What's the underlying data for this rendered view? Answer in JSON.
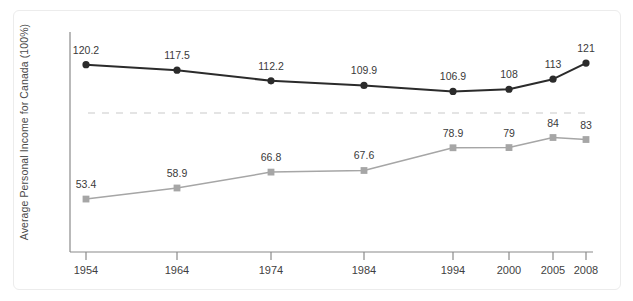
{
  "chart_data": {
    "type": "line",
    "title": "",
    "subtitle": "",
    "xlabel": "",
    "ylabel": "Average Personal Income for Canada (100%)",
    "categories": [
      "1954",
      "1964",
      "1974",
      "1984",
      "1994",
      "2000",
      "2005",
      "2008"
    ],
    "x": [
      1954,
      1964,
      1974,
      1984,
      1994,
      2000,
      2005,
      2008
    ],
    "xlim": [
      1954,
      2008
    ],
    "ylim": [
      40,
      130
    ],
    "grid": false,
    "legend": "none",
    "reference_line": {
      "value": 100,
      "style": "dashed",
      "color": "#d8d8d8",
      "label": ""
    },
    "series": [
      {
        "name": "upper-series",
        "color": "#2b2b2b",
        "marker": "circle",
        "values": [
          120.2,
          117.5,
          112.2,
          109.9,
          106.9,
          108,
          113,
          121
        ],
        "labels": [
          "120.2",
          "117.5",
          "112.2",
          "109.9",
          "106.9",
          "108",
          "113",
          "121"
        ]
      },
      {
        "name": "lower-series",
        "color": "#a6a6a6",
        "marker": "square",
        "values": [
          53.4,
          58.9,
          66.8,
          67.6,
          78.9,
          79,
          84,
          83
        ],
        "labels": [
          "53.4",
          "58.9",
          "66.8",
          "67.6",
          "78.9",
          "79",
          "84",
          "83"
        ]
      }
    ]
  },
  "axes": {
    "y_axis_label": "Average Personal Income for Canada (100%)",
    "x_tick_labels": [
      "1954",
      "1964",
      "1974",
      "1984",
      "1994",
      "2000",
      "2005",
      "2008"
    ],
    "axis_color": "#808080"
  },
  "colors": {
    "upper_line": "#2b2b2b",
    "lower_line": "#a6a6a6",
    "reference_dash": "#dcdcdc",
    "card_border": "#ececec",
    "text": "#3a3a3a"
  }
}
